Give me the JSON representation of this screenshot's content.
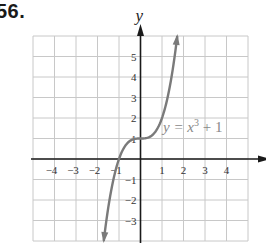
{
  "problem_number": "56.",
  "chart_data": {
    "type": "line",
    "title": "",
    "function": "y = x^3 + 1",
    "annotation": {
      "text_prefix": "y = x",
      "exponent": "3",
      "text_suffix": " + 1"
    },
    "xlabel": "x",
    "ylabel": "y",
    "xlim": [
      -5,
      5
    ],
    "ylim": [
      -4,
      6
    ],
    "grid": true,
    "x_ticks": [
      -4,
      -3,
      -2,
      -1,
      1,
      2,
      3,
      4
    ],
    "y_ticks": [
      -3,
      -2,
      -1,
      1,
      2,
      3,
      4,
      5
    ],
    "x_tick_labels": [
      "−4",
      "−3",
      "−2",
      "−1",
      "1",
      "2",
      "3",
      "4"
    ],
    "y_tick_labels": [
      "−3",
      "−2",
      "−1",
      "1",
      "2",
      "3",
      "4",
      "5"
    ],
    "series": [
      {
        "name": "y = x^3 + 1",
        "x": [
          -1.71,
          -1.5,
          -1.25,
          -1.0,
          -0.75,
          -0.5,
          -0.25,
          0,
          0.25,
          0.5,
          0.75,
          1.0,
          1.25,
          1.5,
          1.71
        ],
        "y": [
          -4.0,
          -2.375,
          -0.953,
          0,
          0.578,
          0.875,
          0.984,
          1,
          1.016,
          1.125,
          1.422,
          2.0,
          2.953,
          4.375,
          6.0
        ],
        "arrows_at_ends": true
      }
    ],
    "colors": {
      "curve": "#7a7a7a",
      "axes": "#1a1a1a",
      "grid": "#c8c8c8"
    }
  }
}
